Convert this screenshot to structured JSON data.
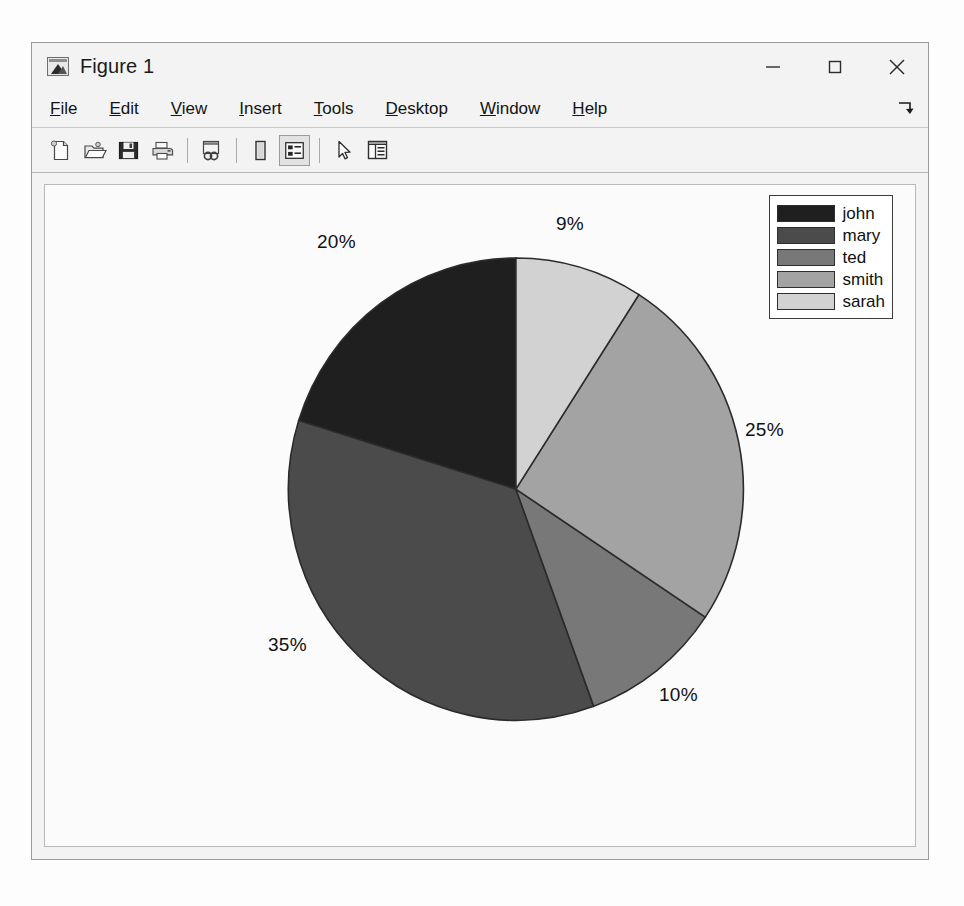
{
  "window": {
    "title": "Figure 1",
    "app_icon": "matlab-figure-icon",
    "controls": [
      {
        "name": "minimize-button",
        "glyph": "minimize-icon"
      },
      {
        "name": "maximize-button",
        "glyph": "maximize-icon"
      },
      {
        "name": "close-button",
        "glyph": "close-icon"
      }
    ]
  },
  "menubar": {
    "items": [
      {
        "label": "File",
        "mnemonic": "F"
      },
      {
        "label": "Edit",
        "mnemonic": "E"
      },
      {
        "label": "View",
        "mnemonic": "V"
      },
      {
        "label": "Insert",
        "mnemonic": "I"
      },
      {
        "label": "Tools",
        "mnemonic": "T"
      },
      {
        "label": "Desktop",
        "mnemonic": "D"
      },
      {
        "label": "Window",
        "mnemonic": "W"
      },
      {
        "label": "Help",
        "mnemonic": "H"
      }
    ],
    "expand_icon": "expand-arrow-icon"
  },
  "toolbar": {
    "buttons": [
      {
        "name": "new-figure-button",
        "icon": "new-document-icon",
        "pressed": false
      },
      {
        "name": "open-file-button",
        "icon": "open-folder-icon",
        "pressed": false
      },
      {
        "name": "save-figure-button",
        "icon": "save-disk-icon",
        "pressed": false
      },
      {
        "name": "print-figure-button",
        "icon": "printer-icon",
        "pressed": false
      },
      {
        "name": "link-plot-button",
        "icon": "link-plot-icon",
        "pressed": false
      },
      {
        "name": "insert-colorbar-button",
        "icon": "colorbar-icon",
        "pressed": false
      },
      {
        "name": "insert-legend-button",
        "icon": "legend-icon",
        "pressed": true
      },
      {
        "name": "edit-plot-button",
        "icon": "pointer-arrow-icon",
        "pressed": false
      },
      {
        "name": "plot-browser-button",
        "icon": "plot-browser-icon",
        "pressed": false
      }
    ]
  },
  "colors": {
    "john": "#1f1f1f",
    "mary": "#4b4b4b",
    "ted": "#787878",
    "smith": "#a3a3a3",
    "sarah": "#d2d2d2",
    "slice_edge": "#2b2b2b",
    "canvas_bg": "#fbfbfb",
    "legend_border": "#3c3c3c",
    "label_text": "#111111"
  },
  "chart_data": {
    "type": "pie",
    "title": "",
    "labels": [
      "john",
      "mary",
      "ted",
      "smith",
      "sarah"
    ],
    "values": [
      20,
      35,
      10,
      25,
      9
    ],
    "display_percentages": [
      "20%",
      "35%",
      "10%",
      "25%",
      "9%"
    ],
    "slice_colors": [
      "#1f1f1f",
      "#4b4b4b",
      "#787878",
      "#a3a3a3",
      "#d2d2d2"
    ],
    "start_angle_deg": 90,
    "direction": "counterclockwise",
    "legend_position": "northeast",
    "legend_entries": [
      "john",
      "mary",
      "ted",
      "smith",
      "sarah"
    ],
    "grid": false,
    "slices": [
      {
        "label": "john",
        "percent": 20,
        "display": "20%",
        "color": "#1f1f1f"
      },
      {
        "label": "mary",
        "percent": 35,
        "display": "35%",
        "color": "#4b4b4b"
      },
      {
        "label": "ted",
        "percent": 10,
        "display": "10%",
        "color": "#787878"
      },
      {
        "label": "smith",
        "percent": 25,
        "display": "25%",
        "color": "#a3a3a3"
      },
      {
        "label": "sarah",
        "percent": 9,
        "display": "9%",
        "color": "#d2d2d2"
      }
    ]
  },
  "pct_labels": [
    {
      "name": "pct-label-sarah",
      "text": "9%",
      "left": 511,
      "top": 28
    },
    {
      "name": "pct-label-smith",
      "text": "25%",
      "left": 700,
      "top": 234
    },
    {
      "name": "pct-label-ted",
      "text": "10%",
      "left": 614,
      "top": 499
    },
    {
      "name": "pct-label-mary",
      "text": "35%",
      "left": 223,
      "top": 449
    },
    {
      "name": "pct-label-john",
      "text": "20%",
      "left": 272,
      "top": 46
    }
  ]
}
